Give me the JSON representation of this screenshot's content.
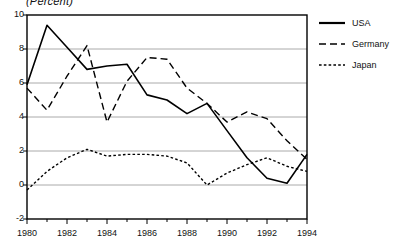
{
  "chart_data": {
    "type": "line",
    "title": "(Percent)",
    "xlabel": "",
    "ylabel": "",
    "ylim": [
      -2,
      10
    ],
    "xlim": [
      1980,
      1994
    ],
    "grid": true,
    "legend_position": "right",
    "y_ticks": [
      "10",
      "8",
      "6",
      "4",
      "2",
      "0",
      "-2"
    ],
    "y_tick_values": [
      10,
      8,
      6,
      4,
      2,
      0,
      -2
    ],
    "x_ticks": [
      "1980",
      "1982",
      "1984",
      "1986",
      "1988",
      "1990",
      "1992",
      "1994"
    ],
    "x_tick_values": [
      1980,
      1982,
      1984,
      1986,
      1988,
      1990,
      1992,
      1994
    ],
    "x_minor_values": [
      1981,
      1983,
      1985,
      1987,
      1989,
      1991,
      1993
    ],
    "x": [
      1980,
      1981,
      1982,
      1983,
      1984,
      1985,
      1986,
      1987,
      1988,
      1989,
      1990,
      1991,
      1992,
      1993,
      1994
    ],
    "series": [
      {
        "name": "USA",
        "style": "solid",
        "color": "#000000",
        "values": [
          5.9,
          9.4,
          8.1,
          6.8,
          7.0,
          7.1,
          5.3,
          5.0,
          4.2,
          4.8,
          3.2,
          1.6,
          0.4,
          0.1,
          1.8
        ]
      },
      {
        "name": "Germany",
        "style": "dashed",
        "color": "#000000",
        "values": [
          5.7,
          4.4,
          6.4,
          8.2,
          3.7,
          6.1,
          7.5,
          7.4,
          5.7,
          4.8,
          3.7,
          4.3,
          3.9,
          2.6,
          1.5
        ]
      },
      {
        "name": "Japan",
        "style": "dotted",
        "color": "#000000",
        "values": [
          -0.3,
          0.8,
          1.6,
          2.1,
          1.7,
          1.8,
          1.8,
          1.7,
          1.3,
          0.0,
          0.7,
          1.2,
          1.6,
          1.1,
          0.8
        ]
      }
    ]
  },
  "legend": {
    "items": [
      {
        "label": "USA",
        "swatch": "solid-line-icon"
      },
      {
        "label": "Germany",
        "swatch": "dashed-line-icon"
      },
      {
        "label": "Japan",
        "swatch": "dotted-line-icon"
      }
    ]
  }
}
